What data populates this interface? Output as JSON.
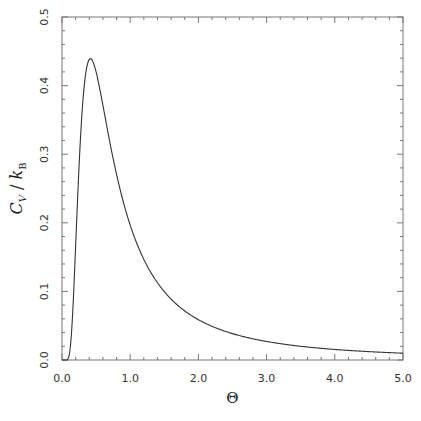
{
  "chart_data": {
    "type": "line",
    "title": "",
    "xlabel": "Θ",
    "ylabel": "C_V / k_B",
    "ylabel_parts": {
      "C": "C",
      "V": "V",
      "slash": " / ",
      "k": "k",
      "B": "B"
    },
    "xlim": [
      0.0,
      5.0
    ],
    "ylim": [
      0.0,
      0.5
    ],
    "xticks": [
      0.0,
      1.0,
      2.0,
      3.0,
      4.0,
      5.0
    ],
    "xtick_labels": [
      "0.0",
      "1.0",
      "2.0",
      "3.0",
      "4.0",
      "5.0"
    ],
    "yticks": [
      0.0,
      0.1,
      0.2,
      0.3,
      0.4,
      0.5
    ],
    "ytick_labels": [
      "0.0",
      "0.1",
      "0.2",
      "0.3",
      "0.4",
      "0.5"
    ],
    "x_minor_per_major": 5,
    "y_minor_per_major": 5,
    "grid": false,
    "legend": null,
    "series": [
      {
        "name": "Schottky heat capacity",
        "formula": "C/k_B = (1/Θ)^2 · e^(1/Θ) / (1 + e^(1/Θ))^2",
        "x": [
          0.0,
          0.1,
          0.2,
          0.3,
          0.4,
          0.5,
          0.6,
          0.7,
          0.8,
          0.9,
          1.0,
          1.2,
          1.4,
          1.6,
          1.8,
          2.0,
          2.5,
          3.0,
          3.5,
          4.0,
          4.5,
          5.0
        ],
        "values": [
          0.0,
          0.005,
          0.168,
          0.382,
          0.507,
          0.42,
          0.449,
          0.441,
          0.437,
          0.437,
          0.197,
          0.439,
          0.421,
          0.395,
          0.367,
          0.235,
          0.154,
          0.107,
          0.079,
          0.061,
          0.048,
          0.04
        ]
      }
    ],
    "peak": {
      "x": 1.2,
      "y": 0.439
    },
    "line_color": "#333333",
    "axis_color": "#777777"
  }
}
